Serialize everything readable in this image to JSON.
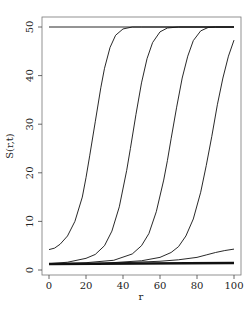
{
  "chart_data": {
    "type": "line",
    "title": "",
    "xlabel": "r",
    "ylabel": "S(r,t)",
    "xlim": [
      0,
      100
    ],
    "ylim": [
      0,
      50
    ],
    "xticks": [
      0,
      20,
      40,
      60,
      80,
      100
    ],
    "yticks": [
      0,
      10,
      20,
      30,
      40,
      50
    ],
    "grid": false,
    "legend": null,
    "series": [
      {
        "name": "upper-bound",
        "thick": false,
        "x": [
          0,
          100
        ],
        "y": [
          50,
          50
        ]
      },
      {
        "name": "curve-1",
        "thick": false,
        "x": [
          0,
          3,
          6,
          10,
          14,
          18,
          20,
          22,
          25,
          28,
          30,
          33,
          36,
          40,
          45,
          50,
          60,
          70,
          80,
          90,
          100
        ],
        "y": [
          4.2,
          4.5,
          5.3,
          7.0,
          10.0,
          15.0,
          19.0,
          23.5,
          30.5,
          37.5,
          41.5,
          45.8,
          48.3,
          49.6,
          50,
          50,
          50,
          50,
          50,
          50,
          50
        ]
      },
      {
        "name": "curve-2",
        "thick": false,
        "x": [
          0,
          10,
          20,
          25,
          30,
          34,
          38,
          42,
          44,
          47,
          50,
          53,
          56,
          60,
          64,
          70,
          80,
          90,
          100
        ],
        "y": [
          1.3,
          1.6,
          2.4,
          3.2,
          5.0,
          8.0,
          13.0,
          20.5,
          25.0,
          32.0,
          38.5,
          43.5,
          46.8,
          49.0,
          49.8,
          50,
          50,
          50,
          50
        ]
      },
      {
        "name": "curve-3",
        "thick": false,
        "x": [
          0,
          20,
          35,
          45,
          50,
          54,
          58,
          62,
          64,
          66,
          69,
          72,
          75,
          78,
          82,
          86,
          90,
          100
        ],
        "y": [
          1.25,
          1.5,
          2.0,
          3.3,
          5.0,
          7.5,
          12.0,
          18.5,
          22.5,
          27.0,
          33.5,
          39.5,
          44.0,
          47.2,
          49.2,
          49.9,
          50,
          50
        ]
      },
      {
        "name": "curve-4",
        "thick": false,
        "x": [
          0,
          30,
          50,
          60,
          66,
          70,
          74,
          78,
          82,
          85,
          88,
          91,
          94,
          97,
          100
        ],
        "y": [
          1.2,
          1.4,
          1.9,
          2.6,
          3.6,
          4.8,
          7.0,
          10.5,
          16.0,
          21.5,
          27.5,
          34.0,
          39.5,
          44.0,
          47.3
        ]
      },
      {
        "name": "curve-5",
        "thick": false,
        "x": [
          0,
          20,
          40,
          60,
          70,
          80,
          85,
          90,
          95,
          100
        ],
        "y": [
          1.2,
          1.3,
          1.5,
          1.8,
          2.1,
          2.6,
          3.1,
          3.6,
          4.0,
          4.3
        ]
      },
      {
        "name": "baseline",
        "thick": true,
        "x": [
          0,
          100
        ],
        "y": [
          1.25,
          1.45
        ]
      }
    ]
  },
  "labels": {
    "xlabel": "r",
    "ylabel": "S(r,t)"
  }
}
